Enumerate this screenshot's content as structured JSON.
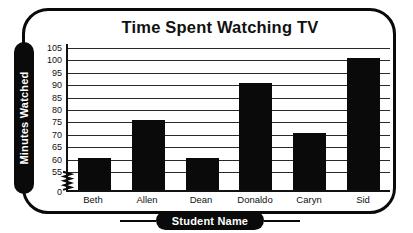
{
  "chart_data": {
    "type": "bar",
    "title": "Time Spent Watching TV",
    "xlabel": "Student Name",
    "ylabel": "Minutes Watched",
    "categories": [
      "Beth",
      "Allen",
      "Dean",
      "Donaldo",
      "Caryn",
      "Sid"
    ],
    "values": [
      60,
      75,
      60,
      90,
      70,
      100
    ],
    "series": [
      {
        "name": "Minutes Watched",
        "values": [
          60,
          75,
          60,
          90,
          70,
          100
        ]
      }
    ],
    "ytick_labels": [
      "105",
      "100",
      "95",
      "90",
      "85",
      "80",
      "75",
      "70",
      "65",
      "60",
      "55",
      "0"
    ],
    "ytick_values": [
      105,
      100,
      95,
      90,
      85,
      80,
      75,
      70,
      65,
      60,
      55,
      0
    ],
    "ylim": [
      55,
      105
    ],
    "axis_break": true,
    "axis_break_between": [
      0,
      55
    ],
    "grid": true,
    "grid_orientation": "horizontal",
    "legend": false,
    "legend_position": "none",
    "bar_color": "#0a0a0a",
    "frame_color": "#0a0a0a",
    "background_color": "#ffffff",
    "text_color": "#111111",
    "pill_text_color": "#ffffff"
  },
  "icons": {
    "axis_break": "axis-break-zigzag-icon"
  }
}
